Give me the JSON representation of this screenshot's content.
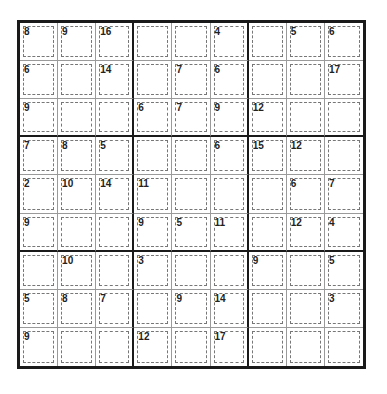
{
  "puzzle": {
    "type": "killer-sudoku",
    "size": 9,
    "colors": {
      "thick_line": "#1a1a1a",
      "thin_line": "#9a9a9a",
      "cage_border": "#777777",
      "background": "#ffffff"
    },
    "cage_sums": [
      [
        "8",
        "9",
        "16",
        "",
        "",
        "4",
        "",
        "5",
        "6"
      ],
      [
        "6",
        "",
        "14",
        "",
        "7",
        "6",
        "",
        "",
        "17"
      ],
      [
        "9",
        "",
        "",
        "6",
        "7",
        "9",
        "12",
        "",
        ""
      ],
      [
        "7",
        "8",
        "5",
        "",
        "",
        "6",
        "15",
        "12",
        ""
      ],
      [
        "2",
        "10",
        "14",
        "11",
        "",
        "",
        "",
        "6",
        "7"
      ],
      [
        "9",
        "",
        "",
        "9",
        "5",
        "11",
        "",
        "12",
        "4"
      ],
      [
        "",
        "10",
        "",
        "3",
        "",
        "",
        "9",
        "",
        "5"
      ],
      [
        "5",
        "8",
        "7",
        "",
        "9",
        "14",
        "",
        "",
        "3"
      ],
      [
        "9",
        "",
        "",
        "12",
        "",
        "17",
        "",
        "",
        ""
      ]
    ]
  }
}
